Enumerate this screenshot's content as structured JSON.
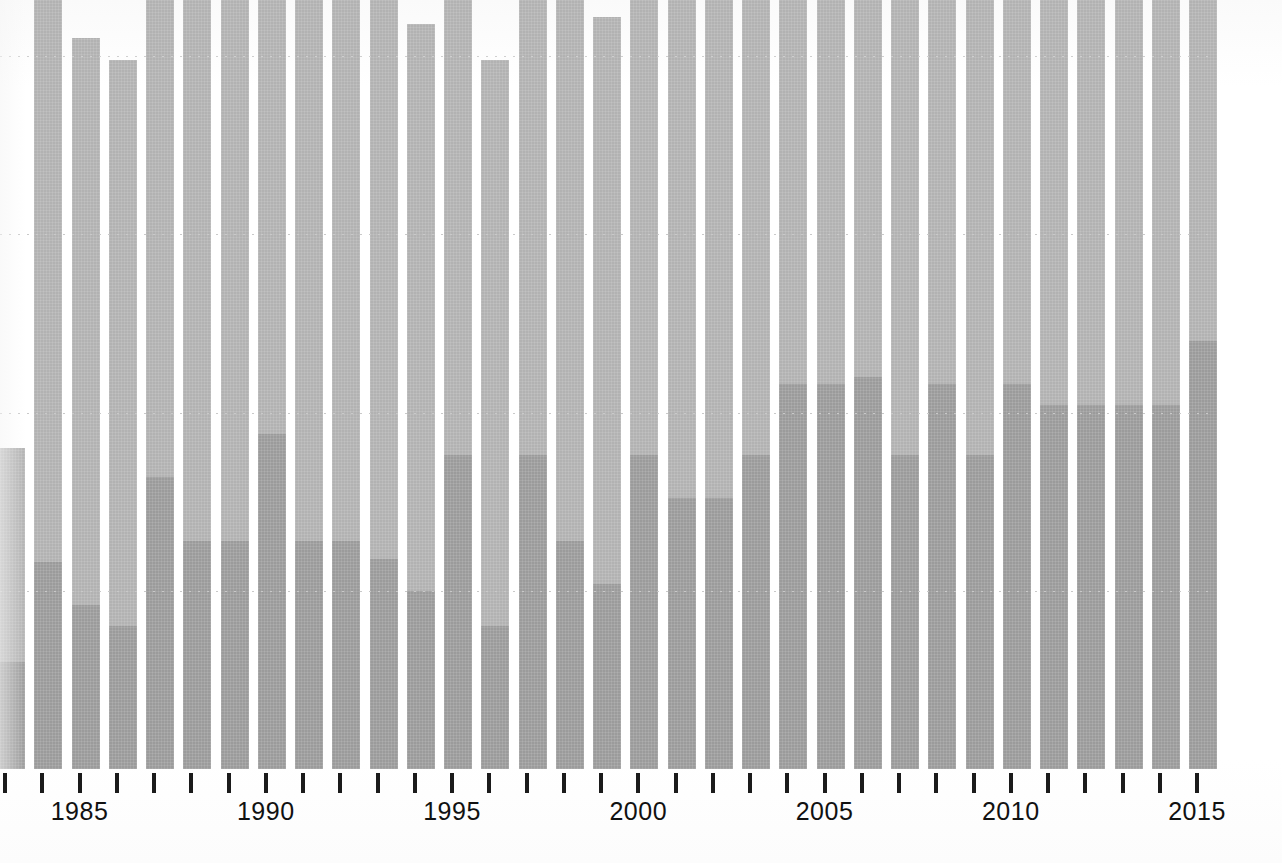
{
  "chart_data": {
    "type": "bar",
    "title": "",
    "subtitle": "",
    "xlabel": "",
    "ylabel": "",
    "stacked": true,
    "grid": true,
    "gridlines_y": [
      0,
      25,
      50,
      75,
      100
    ],
    "ylim": [
      0,
      100
    ],
    "legend_position": "none",
    "series": [
      {
        "name": "upper-segment",
        "color": "#b2b2b2",
        "values": [
          30.0,
          79.5,
          79.5,
          79.5,
          79.5,
          79.5,
          79.5,
          79.5,
          79.5,
          79.5,
          79.5,
          79.5,
          84.5,
          79.5,
          85.5,
          79.5,
          79.5,
          84.5,
          84.5,
          84.5,
          78.0,
          90.0,
          95.5,
          90.0,
          84.5,
          90.0,
          84.5,
          95.0,
          95.0,
          100.0,
          95.0,
          95.0,
          95.0
        ]
      },
      {
        "name": "lower-segment-dark",
        "color": "#9b9b9b",
        "values": [
          15.0,
          29.0,
          23.0,
          20.0,
          41.0,
          32.0,
          32.0,
          47.0,
          32.0,
          32.0,
          29.5,
          25.0,
          44.0,
          20.0,
          44.0,
          32.0,
          26.0,
          44.0,
          38.0,
          38.0,
          44.0,
          54.0,
          54.0,
          55.0,
          44.0,
          54.0,
          44.0,
          54.0,
          51.0,
          51.0,
          51.0,
          51.0,
          60.0
        ]
      }
    ],
    "categories": [
      1983,
      1984,
      1985,
      1986,
      1987,
      1988,
      1989,
      1990,
      1991,
      1992,
      1993,
      1994,
      1995,
      1996,
      1997,
      1998,
      1999,
      2000,
      2001,
      2002,
      2003,
      2004,
      2005,
      2006,
      2007,
      2008,
      2009,
      2010,
      2011,
      2012,
      2013,
      2014,
      2015
    ],
    "x_tick_labels": [
      "1985",
      "1990",
      "1995",
      "2000",
      "2005",
      "2010",
      "2015"
    ],
    "x_tick_label_years": [
      1985,
      1990,
      1995,
      2000,
      2005,
      2010,
      2015
    ],
    "colors": {
      "bar_light": "#b2b2b2",
      "bar_dark": "#9b9b9b",
      "gridline": "#c9c9c9",
      "axis_tick": "#1b1b1b",
      "label_text": "#111111",
      "background": "#ffffff"
    }
  },
  "axis": {
    "tick_count": 33,
    "baseline_y": 769
  }
}
